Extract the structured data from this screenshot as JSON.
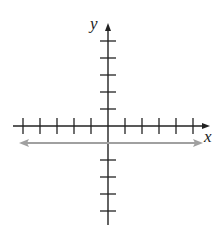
{
  "chart_data": {
    "type": "line",
    "title": "",
    "xlabel": "x",
    "ylabel": "y",
    "xlim": [
      -5,
      5
    ],
    "ylim": [
      -5,
      5
    ],
    "grid": false,
    "x_ticks": [
      -5,
      -4,
      -3,
      -2,
      -1,
      1,
      2,
      3,
      4,
      5
    ],
    "y_ticks": [
      -5,
      -4,
      -3,
      -2,
      -1,
      1,
      2,
      3,
      4,
      5
    ],
    "tick_labels_shown": false,
    "series": [
      {
        "name": "y = -1",
        "equation": "y = -1",
        "x": [
          -5,
          5
        ],
        "y": [
          -1,
          -1
        ],
        "color": "#a0a0a0",
        "arrows": "both"
      }
    ]
  },
  "labels": {
    "x_axis": "x",
    "y_axis": "y"
  },
  "colors": {
    "axes": "#222222",
    "line": "#a0a0a0"
  }
}
